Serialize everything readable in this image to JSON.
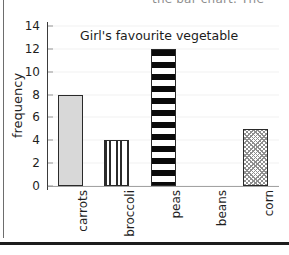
{
  "page": {
    "header_cut_text": "the bar chart. The",
    "bottom_rule": "divider"
  },
  "chart_data": {
    "type": "bar",
    "title": "Girl's favourite vegetable",
    "xlabel": "",
    "ylabel": "frequency",
    "categories": [
      "carrots",
      "broccoli",
      "peas",
      "beans",
      "corn"
    ],
    "values": [
      8,
      4,
      12,
      0,
      5
    ],
    "ylim": [
      0,
      14
    ],
    "ytick_values": [
      0,
      2,
      4,
      6,
      8,
      10,
      12,
      14
    ],
    "ytick_labels": [
      "0",
      "2",
      "4",
      "6",
      "8",
      "10",
      "12",
      "14"
    ],
    "ytick_step": 2,
    "grid": false,
    "legend": null,
    "bar_patterns": [
      "dots",
      "vertical-stripes",
      "horizontal-stripes",
      "none",
      "diagonal-hatch"
    ],
    "series": [
      {
        "name": "frequency",
        "values": [
          8,
          4,
          12,
          0,
          5
        ]
      }
    ],
    "colors": {
      "axis": "#3b3b3b",
      "bar_outline": "#2a2a2a",
      "text": "#1f1f1f",
      "background": "#ffffff"
    }
  }
}
